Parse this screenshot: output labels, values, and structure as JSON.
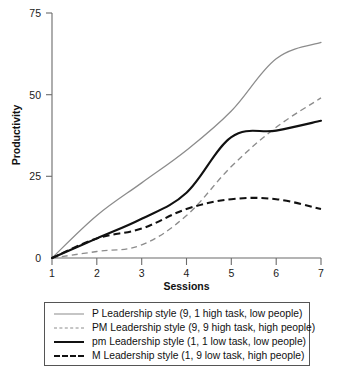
{
  "chart_data": {
    "type": "line",
    "title": "",
    "xlabel": "Sessions",
    "ylabel": "Productivity",
    "x": [
      1,
      2,
      3,
      4,
      5,
      6,
      7
    ],
    "xlim": [
      1,
      7
    ],
    "ylim": [
      0,
      75
    ],
    "xticks": [
      "1",
      "2",
      "3",
      "4",
      "5",
      "6",
      "7"
    ],
    "yticks": [
      "0",
      "25",
      "50",
      "75"
    ],
    "grid": false,
    "legend_position": "below-plot",
    "series": [
      {
        "name": "P Leadership style (9, 1 high task, low people)",
        "key": "P",
        "style": "solid",
        "color": "#8c8c8c",
        "width": "thin",
        "values": [
          0,
          13,
          23,
          33,
          45,
          61,
          66
        ]
      },
      {
        "name": "PM Leadership style (9, 9 high task, high people)",
        "key": "PM",
        "style": "dashed",
        "color": "#8c8c8c",
        "width": "thin",
        "values": [
          0,
          2,
          4,
          13,
          28,
          40,
          49
        ]
      },
      {
        "name": "pm Leadership style (1, 1 low task, low people)",
        "key": "pm",
        "style": "solid",
        "color": "#111111",
        "width": "thick",
        "values": [
          0,
          6,
          12,
          20,
          37,
          39,
          42
        ]
      },
      {
        "name": "M Leadership style (1, 9 low task, high people)",
        "key": "M",
        "style": "dashed",
        "color": "#111111",
        "width": "thick",
        "values": [
          0,
          6,
          9,
          15,
          18,
          18,
          15
        ]
      }
    ]
  },
  "axes": {
    "y_label": "Productivity",
    "x_label": "Sessions",
    "y_ticks": [
      "75",
      "50",
      "25",
      "0"
    ],
    "x_ticks": [
      "1",
      "2",
      "3",
      "4",
      "5",
      "6",
      "7"
    ]
  },
  "legend": {
    "items": [
      {
        "label": "P Leadership style (9, 1 high task, low people)",
        "swatch": "thin-gray-solid-line"
      },
      {
        "label": "PM Leadership style (9, 9 high task, high people)",
        "swatch": "thin-gray-dashed-line"
      },
      {
        "label": "pm Leadership style (1, 1 low task, low people)",
        "swatch": "thick-black-solid-line"
      },
      {
        "label": "M Leadership style (1, 9 low task, high people)",
        "swatch": "thick-black-dashed-line"
      }
    ]
  },
  "colors": {
    "gray_series": "#8c8c8c",
    "black_series": "#111111",
    "axis": "#6b6b6b",
    "legend_border": "#555555",
    "background": "#ffffff"
  }
}
